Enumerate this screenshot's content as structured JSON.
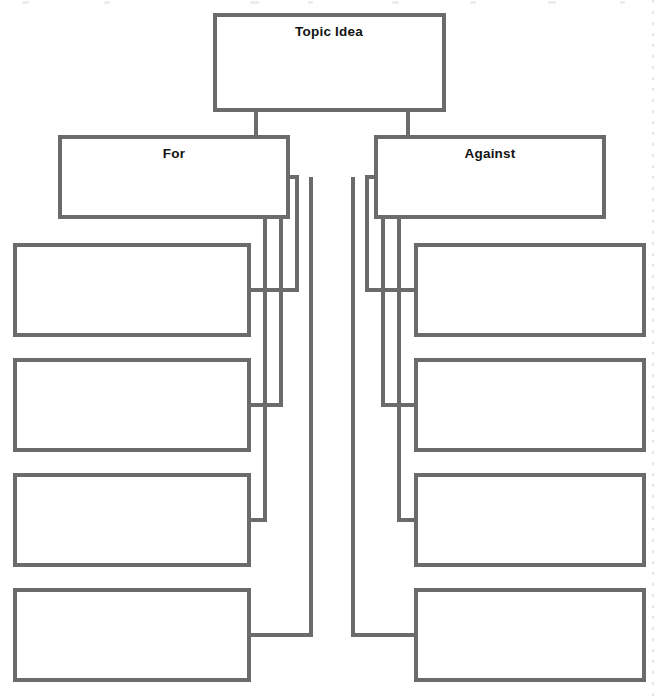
{
  "diagram": {
    "type": "argument-graphic-organizer",
    "title_node": {
      "id": "topic",
      "label": "Topic Idea"
    },
    "branches": [
      {
        "id": "for",
        "label": "For",
        "side": "left",
        "reasons": [
          {
            "id": "for-reason-1",
            "label": ""
          },
          {
            "id": "for-reason-2",
            "label": ""
          },
          {
            "id": "for-reason-3",
            "label": ""
          },
          {
            "id": "for-reason-4",
            "label": ""
          }
        ]
      },
      {
        "id": "against",
        "label": "Against",
        "side": "right",
        "reasons": [
          {
            "id": "against-reason-1",
            "label": ""
          },
          {
            "id": "against-reason-2",
            "label": ""
          },
          {
            "id": "against-reason-3",
            "label": ""
          },
          {
            "id": "against-reason-4",
            "label": ""
          }
        ]
      }
    ],
    "colors": {
      "box_stroke": "#6b6b6b",
      "connector_stroke": "#6b6b6b",
      "box_fill": "#ffffff",
      "label_text": "#131313",
      "page_background": "#ffffff"
    },
    "stroke_width": 4
  }
}
